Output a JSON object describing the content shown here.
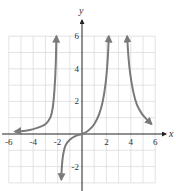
{
  "chart_data": {
    "type": "line",
    "title": "",
    "xlabel": "x",
    "ylabel": "y",
    "xlim": [
      -6,
      6
    ],
    "ylim": [
      -3,
      6
    ],
    "grid": true,
    "grid_step": 1,
    "x_ticks": [
      -6,
      -4,
      -2,
      2,
      4,
      6
    ],
    "y_ticks": [
      6,
      4,
      2,
      -2
    ],
    "x_tick_labels": [
      "-6",
      "-4",
      "-2",
      "2",
      "4",
      "6"
    ],
    "y_tick_labels": [
      "6",
      "4",
      "2",
      "-2"
    ],
    "vertical_asymptotes": [
      -2,
      3
    ],
    "series": [
      {
        "name": "left-branch",
        "points": [
          [
            -5.5,
            0.15
          ],
          [
            -4.5,
            0.22
          ],
          [
            -4,
            0.3
          ],
          [
            -3.5,
            0.42
          ],
          [
            -3,
            0.6
          ],
          [
            -2.6,
            1.0
          ],
          [
            -2.4,
            1.6
          ],
          [
            -2.25,
            2.8
          ],
          [
            -2.15,
            4.3
          ],
          [
            -2.1,
            6
          ]
        ],
        "arrows": "both"
      },
      {
        "name": "middle-branch",
        "points": [
          [
            -1.7,
            -2.8
          ],
          [
            -1.65,
            -2.0
          ],
          [
            -1.55,
            -1.3
          ],
          [
            -1.35,
            -0.7
          ],
          [
            -1.0,
            -0.35
          ],
          [
            -0.5,
            -0.12
          ],
          [
            0,
            0
          ],
          [
            0.5,
            0.2
          ],
          [
            1.0,
            0.6
          ],
          [
            1.4,
            1.2
          ],
          [
            1.7,
            2.0
          ],
          [
            1.95,
            3.2
          ],
          [
            2.1,
            4.5
          ],
          [
            2.2,
            6
          ]
        ],
        "arrows": "both"
      },
      {
        "name": "right-branch",
        "points": [
          [
            3.7,
            6
          ],
          [
            3.8,
            4.8
          ],
          [
            3.95,
            3.7
          ],
          [
            4.2,
            2.6
          ],
          [
            4.5,
            1.8
          ],
          [
            4.9,
            1.25
          ],
          [
            5.3,
            0.9
          ],
          [
            5.7,
            0.6
          ]
        ],
        "arrows": "both"
      }
    ],
    "colors": {
      "curve": "#7a7a7a",
      "axis": "#333333",
      "grid": "#dcdcdc"
    }
  }
}
